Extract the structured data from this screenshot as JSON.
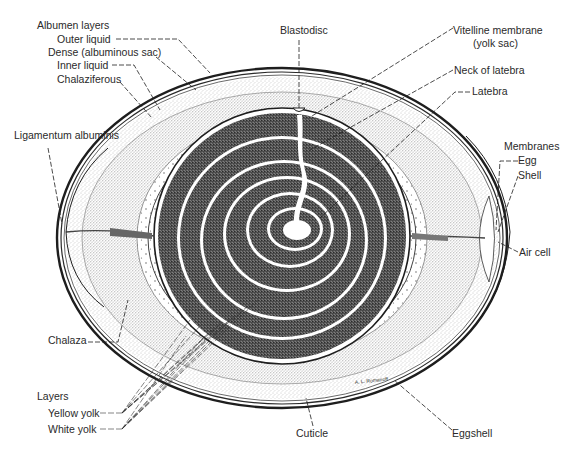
{
  "diagram": {
    "colors": {
      "ink": "#1e1e1e",
      "albumen_stipple": "#9a9a9a",
      "yolk_dark": "#3a3a3a",
      "yolk_light": "#ffffff",
      "background": "#ffffff"
    },
    "labels": {
      "albumen_layers": "Albumen layers",
      "outer_liquid": "Outer liquid",
      "dense": "Dense (albuminous sac)",
      "inner_liquid": "Inner liquid",
      "chalaziferous": "Chalaziferous",
      "ligamentum": "Ligamentum albuminis",
      "chalaza": "Chalaza",
      "layers": "Layers",
      "yellow_yolk": "Yellow yolk",
      "white_yolk": "White yolk",
      "blastodisc": "Blastodisc",
      "vitelline_1": "Vitelline membrane",
      "vitelline_2": "(yolk sac)",
      "neck_latebra": "Neck of latebra",
      "latebra": "Latebra",
      "membranes": "Membranes",
      "egg": "Egg",
      "shell": "Shell",
      "air_cell": "Air cell",
      "cuticle": "Cuticle",
      "eggshell": "Eggshell",
      "signature": "A. L. Romanoff"
    }
  }
}
